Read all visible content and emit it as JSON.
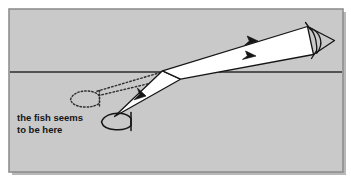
{
  "figure": {
    "type": "optics-refraction-diagram",
    "caption": {
      "line1": "the fish seems",
      "line2": "to be here"
    },
    "colors": {
      "page_background": "#ffffff",
      "panel_background": "#c9c9c9",
      "panel_border": "#8f8f8f",
      "ink": "#151515",
      "beam_fill": "#ffffff",
      "water_surface_line": "#2b2b2b",
      "shadow": "#b0b0b0"
    },
    "panel": {
      "x": 9,
      "y": 9,
      "width": 334,
      "height": 163
    },
    "water_surface": {
      "label": "water-surface",
      "y": 72,
      "x_start": 11,
      "x_end": 341
    },
    "elements": {
      "real_fish": {
        "label": "real fish",
        "style": "solid-outline",
        "x": 116,
        "y": 121
      },
      "apparent_fish": {
        "label": "apparent fish image",
        "style": "dotted-outline",
        "x": 84,
        "y": 99
      },
      "eye": {
        "label": "observer eye",
        "x": 319,
        "y": 38
      },
      "refraction_point": {
        "x": 166,
        "y": 72
      }
    },
    "rays": {
      "underwater_beam": {
        "label": "incident ray from fish to surface",
        "arrow_direction": "up-right",
        "arrow_count": 1
      },
      "air_beam": {
        "label": "refracted ray from surface to eye",
        "arrow_direction": "up-right",
        "arrow_count": 2
      },
      "virtual_rays": {
        "label": "backward extension to apparent image",
        "style": "dotted",
        "count": 2
      }
    }
  }
}
